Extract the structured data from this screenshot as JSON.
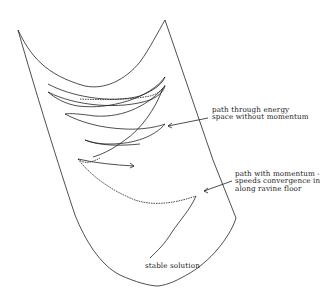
{
  "diagram": {
    "labels": {
      "no_momentum_line1": "path through energy",
      "no_momentum_line2": "space without momentum",
      "momentum_line1": "path with momentum -",
      "momentum_line2": "speeds convergence in",
      "momentum_line3": "along ravine floor",
      "stable": "stable solution"
    },
    "elements": [
      {
        "id": "energy-surface",
        "type": "ravine outline"
      },
      {
        "id": "path-without-momentum",
        "type": "zigzag solid path with arrowhead"
      },
      {
        "id": "path-with-momentum",
        "type": "dashed path"
      },
      {
        "id": "arrow-no-momentum",
        "type": "pointer arrow"
      },
      {
        "id": "arrow-momentum",
        "type": "pointer arrow"
      }
    ],
    "colors": {
      "stroke": "#222222",
      "background": "#ffffff"
    }
  }
}
